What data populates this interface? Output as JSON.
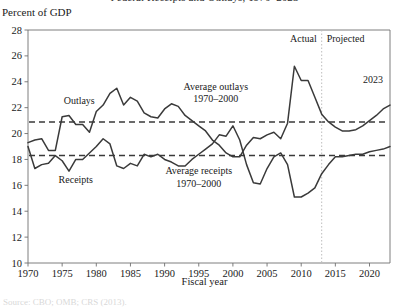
{
  "figure": {
    "title": "Federal Receipts and Outlays, 1970–2023",
    "y_axis_unit_label": "Percent of GDP",
    "x_axis_title": "Fiscal year",
    "source_note": "Source: CBO; OMB; CRS (2013)."
  },
  "annotations": {
    "actual_label": "Actual",
    "projected_label": "Projected",
    "outlays_label": "Outlays",
    "receipts_label": "Receipts",
    "avg_outlays_line1": "Average outlays",
    "avg_outlays_line2": "1970–2000",
    "avg_receipts_line1": "Average receipts",
    "avg_receipts_line2": "1970–2000",
    "end_year_label": "2023"
  },
  "colors": {
    "line": "#3a3a3a",
    "axis": "#6f6f6f",
    "divider": "#bdbdbd",
    "text": "#1a1a1a"
  },
  "chart_data": {
    "type": "line",
    "title": "Federal Receipts and Outlays, 1970–2023",
    "xlabel": "Fiscal year",
    "ylabel": "Percent of GDP",
    "xlim": [
      1970,
      2023
    ],
    "ylim": [
      10,
      28
    ],
    "ytick_labels": [
      "10",
      "12",
      "14",
      "16",
      "18",
      "20",
      "22",
      "24",
      "26",
      "28"
    ],
    "yticks": [
      10,
      12,
      14,
      16,
      18,
      20,
      22,
      24,
      26,
      28
    ],
    "xtick_labels": [
      "1970",
      "1975",
      "1980",
      "1985",
      "1990",
      "1995",
      "2000",
      "2005",
      "2010",
      "2015",
      "2020"
    ],
    "xticks": [
      1970,
      1975,
      1980,
      1985,
      1990,
      1995,
      2000,
      2005,
      2010,
      2015,
      2020
    ],
    "grid": false,
    "legend_position": "inline-annotation",
    "actual_projected_split_year": 2013,
    "reference_lines": [
      {
        "name": "Average outlays 1970–2000",
        "value": 20.9,
        "style": "dashed"
      },
      {
        "name": "Average receipts 1970–2000",
        "value": 18.3,
        "style": "dashed"
      }
    ],
    "x": [
      1970,
      1971,
      1972,
      1973,
      1974,
      1975,
      1976,
      1977,
      1978,
      1979,
      1980,
      1981,
      1982,
      1983,
      1984,
      1985,
      1986,
      1987,
      1988,
      1989,
      1990,
      1991,
      1992,
      1993,
      1994,
      1995,
      1996,
      1997,
      1998,
      1999,
      2000,
      2001,
      2002,
      2003,
      2004,
      2005,
      2006,
      2007,
      2008,
      2009,
      2010,
      2011,
      2012,
      2013,
      2014,
      2015,
      2016,
      2017,
      2018,
      2019,
      2020,
      2021,
      2022,
      2023
    ],
    "series": [
      {
        "name": "Outlays",
        "values": [
          19.3,
          19.5,
          19.6,
          18.7,
          18.7,
          21.3,
          21.4,
          20.7,
          20.7,
          20.1,
          21.7,
          22.2,
          23.1,
          23.5,
          22.2,
          22.8,
          22.5,
          21.6,
          21.3,
          21.2,
          21.9,
          22.3,
          22.1,
          21.4,
          21.0,
          20.6,
          20.2,
          19.5,
          19.1,
          18.5,
          18.2,
          18.2,
          19.1,
          19.7,
          19.6,
          19.9,
          20.1,
          19.6,
          20.8,
          25.2,
          24.1,
          24.1,
          22.8,
          21.5,
          20.9,
          20.5,
          20.2,
          20.2,
          20.3,
          20.6,
          21.0,
          21.4,
          21.9,
          22.2
        ]
      },
      {
        "name": "Receipts",
        "values": [
          19.0,
          17.3,
          17.6,
          17.7,
          18.3,
          17.9,
          17.1,
          18.0,
          18.0,
          18.5,
          19.0,
          19.6,
          19.2,
          17.5,
          17.3,
          17.7,
          17.5,
          18.4,
          18.2,
          18.4,
          18.0,
          17.8,
          17.5,
          17.5,
          18.0,
          18.4,
          18.8,
          19.2,
          19.9,
          19.8,
          20.6,
          19.5,
          17.6,
          16.2,
          16.1,
          17.3,
          18.2,
          18.5,
          17.6,
          15.1,
          15.1,
          15.4,
          15.8,
          16.9,
          17.6,
          18.2,
          18.2,
          18.3,
          18.4,
          18.4,
          18.6,
          18.7,
          18.8,
          19.0
        ]
      }
    ]
  }
}
